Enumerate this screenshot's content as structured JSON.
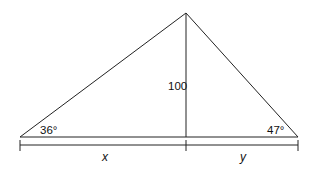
{
  "diagram": {
    "type": "right-triangle-decomposition",
    "vertices": {
      "left": [
        20,
        137
      ],
      "apex": [
        186,
        13
      ],
      "right": [
        298,
        137
      ],
      "foot": [
        186,
        137
      ]
    },
    "labels": {
      "height": "100",
      "left_angle": "36°",
      "right_angle": "47°",
      "left_segment": "x",
      "right_segment": "y"
    },
    "stroke_color": "#222222"
  }
}
